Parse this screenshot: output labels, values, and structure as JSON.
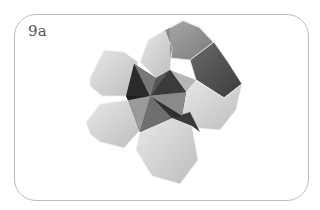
{
  "figure": {
    "label": "9a",
    "colors": {
      "frame_border": "#bdbdbd",
      "label_text": "#555555",
      "light_face": "#d9d9d9",
      "mid_face": "#9a9a9a",
      "dark_face": "#555555",
      "darkest_face": "#2a2a2a"
    }
  }
}
